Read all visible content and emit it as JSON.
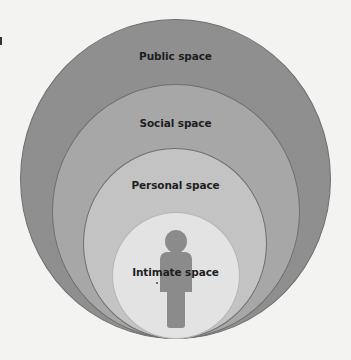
{
  "diagram": {
    "zones": [
      {
        "id": "public",
        "label": "Public space",
        "color": "#8f8f8f"
      },
      {
        "id": "social",
        "label": "Social space",
        "color": "#a7a7a7"
      },
      {
        "id": "personal",
        "label": "Personal space",
        "color": "#c3c3c3"
      },
      {
        "id": "intimate",
        "label": "Intimate space",
        "color": "#e3e3e3"
      }
    ],
    "figure": {
      "type": "person-icon",
      "color": "#8b8b8b"
    },
    "background_color": "#f3f3f1"
  }
}
